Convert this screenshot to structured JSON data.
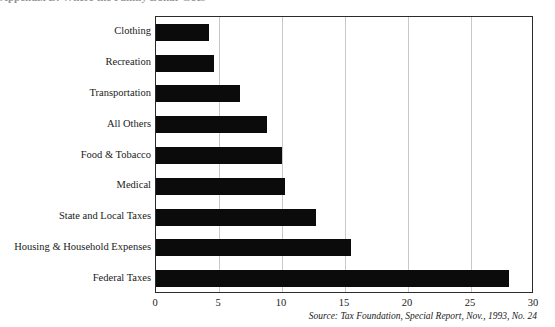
{
  "figure": {
    "title_remnant": "Appendix B: Where the Family Dollar Goes",
    "source_note": "Source: Tax Foundation, Special Report, Nov., 1993, No. 24",
    "bar_color": "#0b0b0b",
    "grid_color": "#c9c9c9",
    "frame_color": "#2b2b2b"
  },
  "chart_data": {
    "type": "bar",
    "orientation": "horizontal",
    "title": "",
    "xlabel": "",
    "ylabel": "",
    "xlim": [
      0,
      30
    ],
    "ylim": [
      0,
      9
    ],
    "grid": true,
    "legend": false,
    "xticks": [
      0,
      5,
      10,
      15,
      20,
      25,
      30
    ],
    "xticklabels": [
      "0",
      "5",
      "10",
      "15",
      "20",
      "25",
      "30"
    ],
    "categories": [
      "Clothing",
      "Recreation",
      "Transportation",
      "All Others",
      "Food & Tobacco",
      "Medical",
      "State and Local Taxes",
      "Housing & Household Expenses",
      "Federal Taxes"
    ],
    "values": [
      4.2,
      4.6,
      6.7,
      8.8,
      10.0,
      10.2,
      12.7,
      15.5,
      28.0
    ],
    "source": "Source: Tax Foundation, Special Report, Nov., 1993, No. 24"
  }
}
